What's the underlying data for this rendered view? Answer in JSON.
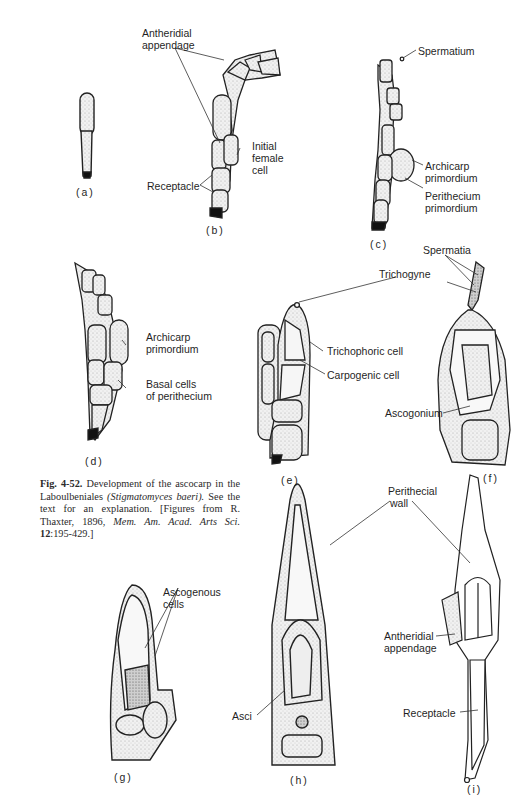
{
  "figure": {
    "number": "Fig. 4-52.",
    "caption_text": "Development of the ascocarp in the Laboulbeniales",
    "caption_species": "(Stigmatomyces baeri).",
    "caption_rest": "See the text for an explanation. [Figures from R. Thaxter, 1896,",
    "caption_journal": "Mem. Am. Acad. Arts Sci.",
    "caption_volume": "12",
    "caption_pages": ":195-429.]"
  },
  "panels": {
    "a": {
      "tag": "(a)"
    },
    "b": {
      "tag": "(b)",
      "labels": {
        "antheridial_1": "Antheridial",
        "antheridial_2": "appendage",
        "initial_1": "Initial",
        "initial_2": "female",
        "initial_3": "cell",
        "receptacle": "Receptacle"
      }
    },
    "c": {
      "tag": "(c)",
      "labels": {
        "spermatium": "Spermatium",
        "archicarp_1": "Archicarp",
        "archicarp_2": "primordium",
        "perithecium_1": "Perithecium",
        "perithecium_2": "primordium"
      }
    },
    "d": {
      "tag": "(d)",
      "labels": {
        "archicarp_1": "Archicarp",
        "archicarp_2": "primordium",
        "basal_1": "Basal cells",
        "basal_2": "of perithecium"
      }
    },
    "e": {
      "tag": "(e)",
      "labels": {
        "trichophoric": "Trichophoric cell",
        "carpogenic": "Carpogenic cell"
      }
    },
    "ef_shared": {
      "spermatia": "Spermatia",
      "trichogyne": "Trichogyne"
    },
    "f": {
      "tag": "(f)",
      "labels": {
        "ascogonium": "Ascogonium"
      }
    },
    "g": {
      "tag": "(g)",
      "labels": {
        "ascogenous_1": "Ascogenous",
        "ascogenous_2": "cells"
      }
    },
    "h": {
      "tag": "(h)",
      "labels": {
        "asci": "Asci"
      }
    },
    "hi_shared": {
      "perithecial_1": "Perithecial",
      "perithecial_2": "wall"
    },
    "i": {
      "tag": "(i)",
      "labels": {
        "antheridial_1": "Antheridial",
        "antheridial_2": "appendage",
        "receptacle": "Receptacle"
      }
    }
  }
}
